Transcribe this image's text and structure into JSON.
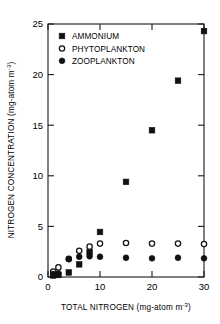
{
  "chart_data": {
    "type": "scatter",
    "title": "",
    "xlabel": "TOTAL NITROGEN (mg-atom m-3)",
    "xlabel_main": "TOTAL NITROGEN (mg-atom m",
    "xlabel_exp": "-3",
    "xlabel_tail": ")",
    "ylabel": "NITROGEN CONCENTRATION (mg-atom m-3)",
    "ylabel_main": "NITROGEN CONCENTRATION (mg-atom m",
    "ylabel_exp": "-3",
    "ylabel_tail": ")",
    "xlim": [
      0,
      30
    ],
    "ylim": [
      0,
      25
    ],
    "xticks": [
      0,
      10,
      20,
      30
    ],
    "xtick_labels": [
      "0",
      "10",
      "20",
      "30"
    ],
    "yticks": [
      0,
      5,
      10,
      15,
      20,
      25
    ],
    "ytick_labels": [
      "0",
      "5",
      "10",
      "15",
      "20",
      "25"
    ],
    "grid": false,
    "legend_position": "upper-left-inside",
    "series": [
      {
        "name": "AMMONIUM",
        "marker": "filled-square",
        "color": "#111111",
        "x": [
          1,
          2,
          4,
          6,
          8,
          10,
          15,
          20,
          25,
          30
        ],
        "y": [
          0.15,
          0.2,
          0.45,
          1.25,
          2.45,
          4.45,
          9.4,
          14.5,
          19.4,
          24.3
        ]
      },
      {
        "name": "PHYTOPLANKTON",
        "marker": "open-circle",
        "color": "#111111",
        "x": [
          1,
          2,
          4,
          6,
          8,
          10,
          15,
          20,
          25,
          30
        ],
        "y": [
          0.55,
          0.95,
          1.8,
          2.6,
          3.0,
          3.3,
          3.35,
          3.3,
          3.3,
          3.25
        ]
      },
      {
        "name": "ZOOPLANKTON",
        "marker": "filled-circle",
        "color": "#111111",
        "x": [
          1,
          2,
          4,
          6,
          8,
          10,
          15,
          20,
          25,
          30
        ],
        "y": [
          0.3,
          0.35,
          1.75,
          2.0,
          2.05,
          2.0,
          1.9,
          1.85,
          1.9,
          1.85
        ]
      }
    ],
    "legend": [
      {
        "label": "AMMONIUM",
        "marker": "filled-square"
      },
      {
        "label": "PHYTOPLANKTON",
        "marker": "open-circle"
      },
      {
        "label": "ZOOPLANKTON",
        "marker": "filled-circle"
      }
    ]
  }
}
